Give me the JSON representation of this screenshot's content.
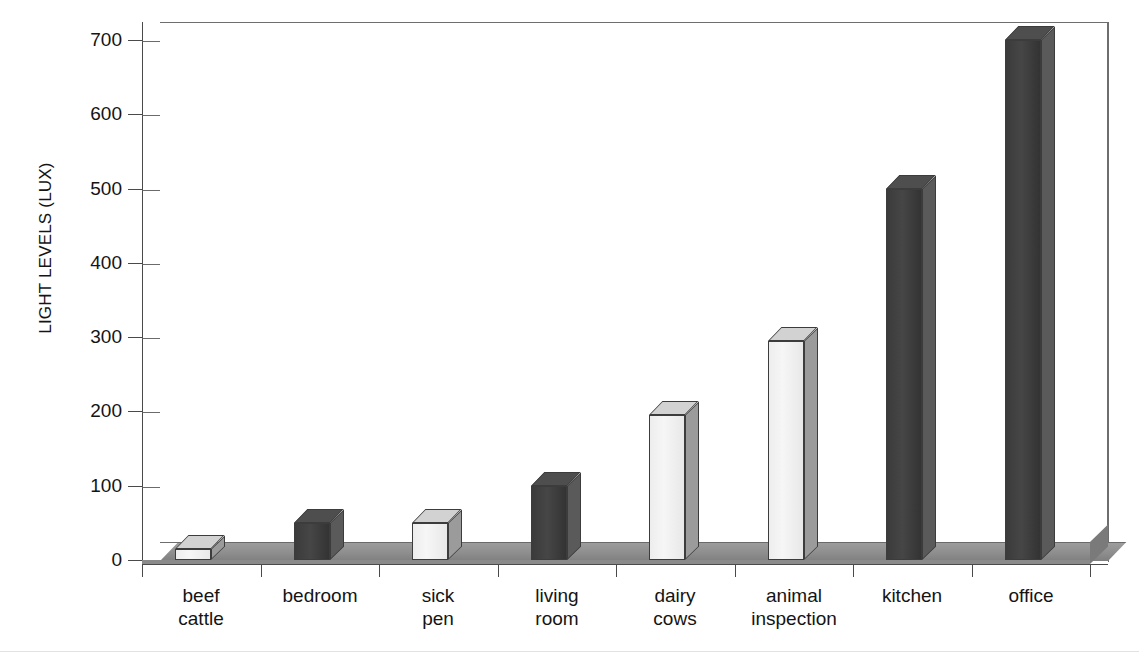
{
  "chart_data": {
    "type": "bar",
    "title": "",
    "xlabel": "",
    "ylabel": "LIGHT LEVELS (LUX)",
    "ylim": [
      0,
      700
    ],
    "ytick_step": 100,
    "grid": true,
    "legend": "none",
    "style": "3d-bar",
    "categories": [
      "beef cattle",
      "bedroom",
      "sick pen",
      "living room",
      "dairy cows",
      "animal inspection",
      "kitchen",
      "office"
    ],
    "category_lines": [
      [
        "beef",
        "cattle"
      ],
      [
        "bedroom",
        ""
      ],
      [
        "sick",
        "pen"
      ],
      [
        "living",
        "room"
      ],
      [
        "dairy",
        "cows"
      ],
      [
        "animal",
        "inspection"
      ],
      [
        "kitchen",
        ""
      ],
      [
        "office",
        ""
      ]
    ],
    "values": [
      15,
      50,
      50,
      100,
      195,
      295,
      500,
      700
    ],
    "bar_shades": [
      "light",
      "dark",
      "light",
      "dark",
      "light",
      "light",
      "dark",
      "dark"
    ],
    "ytick_labels": [
      "0",
      "100",
      "200",
      "300",
      "400",
      "500",
      "600",
      "700"
    ],
    "ytick_values": [
      0,
      100,
      200,
      300,
      400,
      500,
      600,
      700
    ],
    "colors": {
      "bar_light": "#f0f0f0",
      "bar_light_side": "#9b9b9b",
      "bar_dark": "#3d3d3d",
      "bar_dark_side": "#5a5a5a",
      "gridline": "#6e6e6e",
      "axis": "#4a4a4a",
      "floor": "#8a8a8a",
      "text": "#141414",
      "background": "#ffffff"
    }
  }
}
